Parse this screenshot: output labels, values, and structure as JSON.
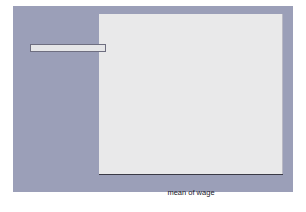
{
  "chart_data": {
    "type": "bar",
    "orientation": "horizontal",
    "title": "",
    "xlabel": "mean of wage",
    "ylabel": "",
    "xlim": [
      0,
      11.3
    ],
    "xticks": [
      0,
      2,
      4,
      6,
      8,
      10
    ],
    "xticklabels": [
      "0",
      "2",
      "4",
      "6",
      "8",
      "10"
    ],
    "grid": false,
    "legend_position": "left-outside",
    "categories": [
      "Prof",
      "Mgmt",
      "Sales",
      "Cler.",
      "Operat.",
      "Labor",
      "Other"
    ],
    "values": [
      10.8,
      11.3,
      7.2,
      8.5,
      4.7,
      4.9,
      7.6
    ],
    "colors": [
      "#3a222a",
      "#6f6a70",
      "#4a4046",
      "#a9779c",
      "#3e232c",
      "#5c607f",
      "#464b46"
    ],
    "series": [
      {
        "name": "mean of wage",
        "points": [
          {
            "category": "Prof",
            "value": 10.8,
            "color": "#3a222a"
          },
          {
            "category": "Mgmt",
            "value": 11.3,
            "color": "#6f6a70"
          },
          {
            "category": "Sales",
            "value": 7.2,
            "color": "#4a4046"
          },
          {
            "category": "Cler.",
            "value": 8.5,
            "color": "#a9779c"
          },
          {
            "category": "Operat.",
            "value": 4.7,
            "color": "#3e232c"
          },
          {
            "category": "Labor",
            "value": 4.9,
            "color": "#5c607f"
          },
          {
            "category": "Other",
            "value": 7.6,
            "color": "#464b46"
          }
        ]
      }
    ]
  },
  "legend": {
    "items": [
      {
        "label": "Prof",
        "color": "#3a222a"
      },
      {
        "label": "Mgmt",
        "color": "#6f6a70"
      },
      {
        "label": "Sales",
        "color": "#4a4046"
      },
      {
        "label": "Cler.",
        "color": "#a9779c"
      },
      {
        "label": "Operat.",
        "color": "#3e232c"
      },
      {
        "label": "Labor",
        "color": "#5c607f"
      },
      {
        "label": "Other",
        "color": "#464b46"
      }
    ]
  },
  "figure": {
    "background": "#9b9fb8",
    "plot_background": "#e9e9ea",
    "axis_color": "#3a3a46"
  }
}
